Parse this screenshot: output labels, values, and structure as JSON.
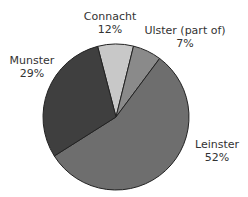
{
  "chart_data": {
    "type": "pie",
    "title": "",
    "categories": [
      "Connacht",
      "Ulster (part of)",
      "Leinster",
      "Munster"
    ],
    "values": [
      12,
      7,
      52,
      29
    ],
    "value_labels": [
      "12%",
      "7%",
      "52%",
      "29%"
    ],
    "unit": "%",
    "legend": "none (direct labels)",
    "slices": [
      {
        "name": "Connacht",
        "label": "Connacht",
        "value": 12,
        "pct_label": "12%",
        "color": "#c8c8c8",
        "start_deg": -14.6,
        "end_deg": 13.9
      },
      {
        "name": "Ulster",
        "label": "Ulster (part of)",
        "value": 7,
        "pct_label": "7%",
        "color": "#8a8a8a",
        "start_deg": 13.9,
        "end_deg": 36.7
      },
      {
        "name": "Leinster",
        "label": "Leinster",
        "value": 52,
        "pct_label": "52%",
        "color": "#6e6e6e",
        "start_deg": 36.7,
        "end_deg": 237.7
      },
      {
        "name": "Munster",
        "label": "Munster",
        "value": 29,
        "pct_label": "29%",
        "color": "#3f3f3f",
        "start_deg": 237.7,
        "end_deg": 345.4
      }
    ],
    "center": [
      116,
      117
    ],
    "radius": 73,
    "outline_color": "#222222"
  },
  "labels": {
    "connacht": {
      "name": "Connacht",
      "pct": "12%"
    },
    "ulster": {
      "name": "Ulster (part of)",
      "pct": "7%"
    },
    "leinster": {
      "name": "Leinster",
      "pct": "52%"
    },
    "munster": {
      "name": "Munster",
      "pct": "29%"
    }
  }
}
